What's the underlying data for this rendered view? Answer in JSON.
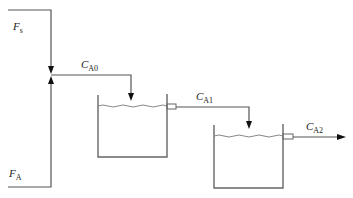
{
  "diagram": {
    "labels": {
      "solvent_feed": {
        "main": "F",
        "sub": "s"
      },
      "reactant_feed": {
        "main": "F",
        "sub": "A"
      },
      "inlet_conc": {
        "main": "C",
        "sub": "A0"
      },
      "tank1_conc": {
        "main": "C",
        "sub": "A1"
      },
      "tank2_conc": {
        "main": "C",
        "sub": "A2"
      }
    },
    "caption": "FIGURE 5.10",
    "colors": {
      "line": "#555555",
      "arrow": "#111111",
      "text": "#222222"
    }
  }
}
